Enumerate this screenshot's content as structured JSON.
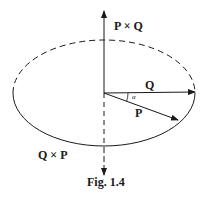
{
  "figure": {
    "caption": "Fig. 1.4",
    "labels": {
      "p_cross_q": "P × Q",
      "q_cross_p": "Q × P",
      "vector_q": "Q",
      "vector_p": "P",
      "angle": "α"
    },
    "colors": {
      "ink": "#1a1a1a",
      "background": "#ffffff"
    },
    "elements": {
      "ellipse": {
        "cx": 104,
        "cy": 93,
        "rx": 91,
        "ry": 53,
        "upper_half": "dashed",
        "lower_half": "solid"
      },
      "vertical_axis": {
        "x": 104,
        "y_top": 10,
        "y_bottom": 176,
        "upper": "solid",
        "lower": "dashed"
      },
      "vector_q": {
        "from": [
          104,
          93
        ],
        "to": [
          196,
          92
        ]
      },
      "vector_p": {
        "from": [
          104,
          93
        ],
        "to": [
          179,
          121
        ]
      }
    }
  }
}
